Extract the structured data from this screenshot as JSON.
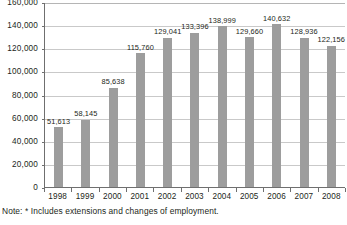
{
  "chart_data": {
    "type": "bar",
    "title": "",
    "xlabel": "",
    "ylabel": "",
    "categories": [
      "1998",
      "1999",
      "2000",
      "2001",
      "2002",
      "2003",
      "2004",
      "2005",
      "2006",
      "2007",
      "2008"
    ],
    "values": [
      51613,
      58145,
      85638,
      115760,
      129041,
      133396,
      138999,
      129660,
      140632,
      128936,
      122156
    ],
    "value_labels": [
      "51,613",
      "58,145",
      "85,638",
      "115,760",
      "129,041",
      "133,396",
      "138,999",
      "129,660",
      "140,632",
      "128,936",
      "122,156"
    ],
    "ylim": [
      0,
      160000
    ],
    "ytick_labels": [
      "0",
      "20,000",
      "40,000",
      "60,000",
      "80,000",
      "100,000",
      "120,000",
      "140,000",
      "160,000"
    ],
    "ytick_values": [
      0,
      20000,
      40000,
      60000,
      80000,
      100000,
      120000,
      140000,
      160000
    ],
    "grid": true,
    "legend": "none",
    "series_color": "#9d9d9d",
    "gridline_color": "#c9c9c9",
    "axis_color": "#6f6f6f"
  },
  "note": {
    "text": "Note: * Includes extensions and changes of employment."
  },
  "title_strip": {
    "text": ""
  }
}
